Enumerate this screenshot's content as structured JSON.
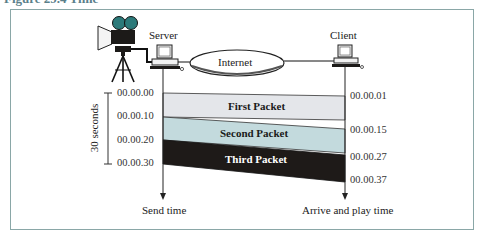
{
  "figure": {
    "caption_fragment": "Figure 29.4  Time"
  },
  "nodes": {
    "server_label": "Server",
    "client_label": "Client",
    "network_label": "Internet"
  },
  "bracket": {
    "label": "30 seconds"
  },
  "send_axis": {
    "label": "Send time",
    "ticks": [
      "00.00.00",
      "00.00.10",
      "00.00.20",
      "00.00.30"
    ]
  },
  "receive_axis": {
    "label": "Arrive and play time",
    "ticks": [
      "00.00.01",
      "00.00.15",
      "00.00.27",
      "00.00.37"
    ]
  },
  "packets": [
    {
      "label": "First Packet",
      "send_start": "00.00.00",
      "send_end": "00.00.10",
      "arrive_start": "00.00.01",
      "arrive_end": "00.00.15",
      "color": "#e4e6ea"
    },
    {
      "label": "Second Packet",
      "send_start": "00.00.10",
      "send_end": "00.00.20",
      "arrive_start": "00.00.15",
      "arrive_end": "00.00.27",
      "color": "#c3dadd"
    },
    {
      "label": "Third Packet",
      "send_start": "00.00.20",
      "send_end": "00.00.30",
      "arrive_start": "00.00.27",
      "arrive_end": "00.00.37",
      "color": "#1e1a18"
    }
  ],
  "colors": {
    "frame": "#8aa7a7",
    "camera_lens": "#2c7a7a"
  }
}
